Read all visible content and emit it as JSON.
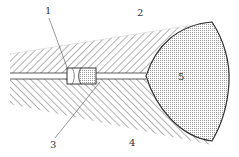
{
  "diagram": {
    "type": "cross-section",
    "colors": {
      "line": "#333333",
      "hatch": "#666666",
      "dots": "#9a9a9a",
      "background": "#ffffff"
    },
    "labels": [
      {
        "id": "1",
        "text": "1",
        "x": 47,
        "y": 13,
        "target": "plug element in channel",
        "leader_to": [
          68,
          70
        ]
      },
      {
        "id": "2",
        "text": "2",
        "x": 138,
        "y": 13,
        "target": "upper hatched body"
      },
      {
        "id": "3",
        "text": "3",
        "x": 51,
        "y": 147,
        "target": "lower hatched body near plug",
        "leader_to": [
          100,
          82
        ]
      },
      {
        "id": "4",
        "text": "4",
        "x": 130,
        "y": 147,
        "target": "lower hatched body"
      },
      {
        "id": "5",
        "text": "5",
        "x": 180,
        "y": 80,
        "target": "dotted bulb region"
      }
    ]
  }
}
